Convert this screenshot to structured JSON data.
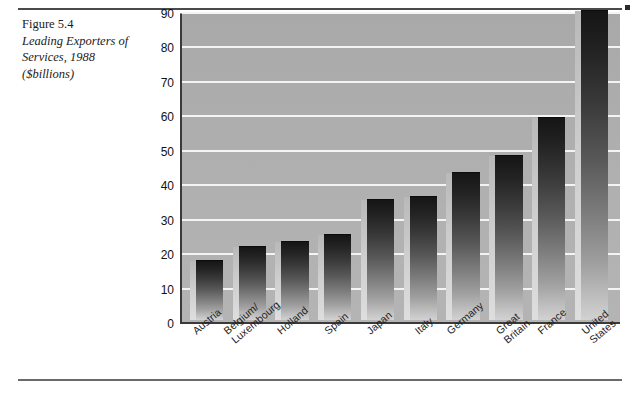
{
  "figure": {
    "number": "Figure 5.4",
    "title_line1": "Leading Exporters of",
    "title_line2": "Services, 1988",
    "title_line3": "($billions)"
  },
  "chart_data": {
    "type": "bar",
    "title": "Leading Exporters of Services, 1988 ($billions)",
    "xlabel": "",
    "ylabel": "$billions",
    "ylim": [
      0,
      90
    ],
    "yticks": [
      90,
      80,
      70,
      60,
      50,
      40,
      30,
      20,
      10,
      0
    ],
    "grid": true,
    "legend": "none",
    "categories": [
      "Austria",
      "Belgium/\nLuxembourg",
      "Holland",
      "Spain",
      "Japan",
      "Italy",
      "Germany",
      "Great Britain",
      "France",
      "United States"
    ],
    "values": [
      17.5,
      21.5,
      23,
      25,
      35,
      36,
      43,
      48,
      59,
      90
    ],
    "colors": {
      "plot_background": "#b0b0b0",
      "gridline": "#f4f4f4",
      "bar_top": "#151515",
      "bar_bottom": "#d2d2d2",
      "axis": "#3a3a3a",
      "text": "#1a1a1a"
    }
  }
}
